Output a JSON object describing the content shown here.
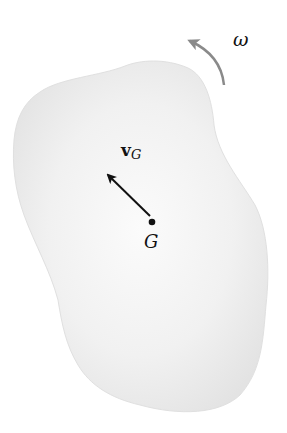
{
  "diagram": {
    "body": {
      "fill": "#ececec",
      "edge": "#e2e2e2"
    },
    "center_of_mass": {
      "label": "G",
      "x": 152,
      "y": 222
    },
    "velocity": {
      "symbol": "v",
      "subscript": "G",
      "tip": [
        106,
        173
      ],
      "tail": [
        150,
        216
      ]
    },
    "angular_velocity": {
      "label": "ω",
      "color": "#8a8a8a",
      "direction": "counterclockwise"
    }
  }
}
